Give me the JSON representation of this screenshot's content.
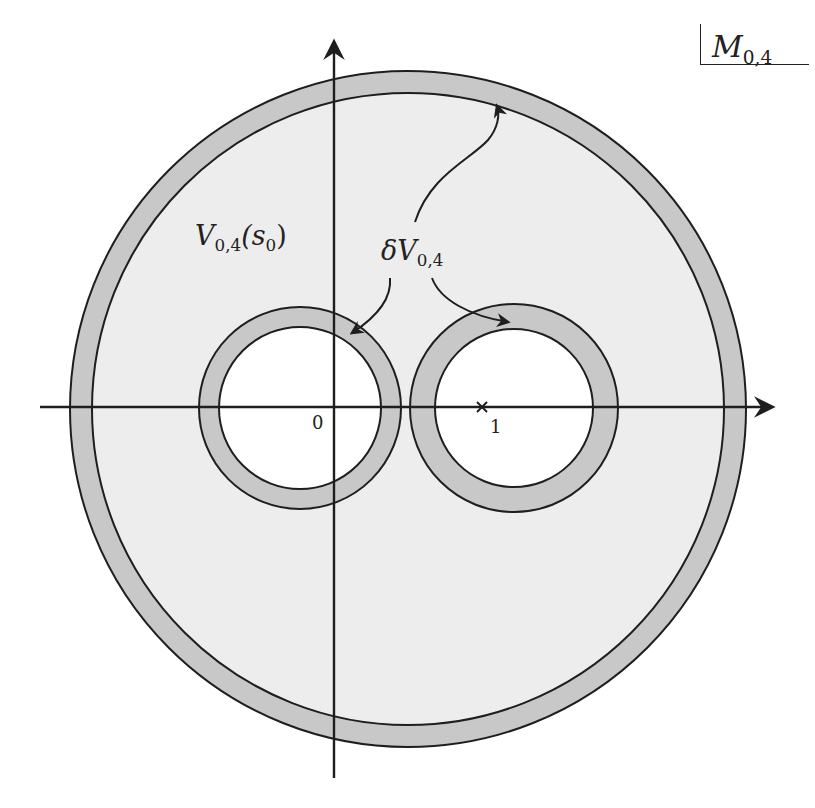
{
  "figure": {
    "space_label": {
      "main": "M",
      "sub": "0,4"
    },
    "region_label": {
      "main": "V",
      "sub": "0,4",
      "arg": "(s",
      "arg_sub": "0",
      "close": ")"
    },
    "boundary_label": {
      "prefix": "δ",
      "main": "V",
      "sub": "0,4"
    },
    "origin_label": "0",
    "point_label": "1",
    "point_marker": "×"
  },
  "colors": {
    "background": "#ffffff",
    "disk_fill": "#ededed",
    "annulus_fill": "#c8c8c8",
    "hole_fill": "#ffffff",
    "stroke": "#1e1e1e"
  },
  "geometry": {
    "big_disk": {
      "cx": 408,
      "cy": 409,
      "r_outer": 338,
      "r_inner": 316
    },
    "left_ring": {
      "cx": 300,
      "cy": 408,
      "r_outer": 101,
      "r_inner": 81
    },
    "right_ring": {
      "cx": 514,
      "cy": 408,
      "r_outer": 104,
      "r_inner": 79
    },
    "x_axis": {
      "y": 407,
      "x1": 40,
      "x2": 776
    },
    "y_axis": {
      "x": 334,
      "y1": 38,
      "y2": 778
    }
  }
}
